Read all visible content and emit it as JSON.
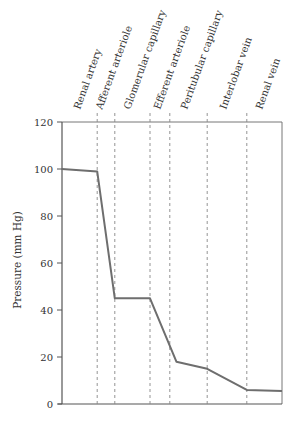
{
  "chart_data": {
    "type": "line",
    "title": "",
    "xlabel": "",
    "ylabel": "Pressure (mm Hg)",
    "ylim": [
      0,
      120
    ],
    "yticks": [
      0,
      20,
      40,
      60,
      80,
      100,
      120
    ],
    "grid": false,
    "legend": null,
    "categories": [
      "Renal artery",
      "Afferent arteriole",
      "Glomerular capillary",
      "Efferent arteriole",
      "Peritubular capillary",
      "Interlobar vein",
      "Renal vein"
    ],
    "series": [
      {
        "name": "Pressure",
        "points": [
          {
            "x": 0.0,
            "y": 100
          },
          {
            "x": 0.16,
            "y": 99
          },
          {
            "x": 0.24,
            "y": 45
          },
          {
            "x": 0.4,
            "y": 45
          },
          {
            "x": 0.52,
            "y": 18
          },
          {
            "x": 0.66,
            "y": 15
          },
          {
            "x": 0.84,
            "y": 6
          },
          {
            "x": 1.0,
            "y": 5.5
          }
        ]
      }
    ],
    "region_boundaries_x": [
      0.16,
      0.24,
      0.4,
      0.49,
      0.66,
      0.84
    ]
  },
  "labels": {
    "y_axis": "Pressure (mm Hg)",
    "y_ticks": [
      "0",
      "20",
      "40",
      "60",
      "80",
      "100",
      "120"
    ],
    "segments": [
      "Renal artery",
      "Afferent arteriole",
      "Glomerular capillary",
      "Efferent arteriole",
      "Peritubular capillary",
      "Interlobar vein",
      "Renal vein"
    ]
  },
  "colors": {
    "line": "#6e6e6e",
    "axis": "#555555",
    "dashed": "#888888"
  }
}
